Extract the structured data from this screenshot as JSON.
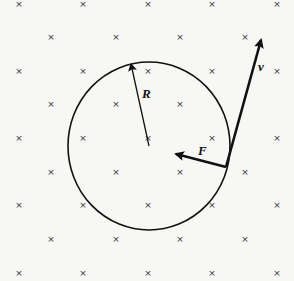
{
  "diagram": {
    "background_color": "#f7f7f5",
    "ink_color": "#111111",
    "field": {
      "symbol": "×",
      "meaning": "magnetic field into page",
      "rows": [
        {
          "y": 7,
          "xs": [
            19,
            83,
            148,
            212,
            277
          ]
        },
        {
          "y": 40,
          "xs": [
            51,
            116,
            180,
            245
          ]
        },
        {
          "y": 74,
          "xs": [
            19,
            83,
            148,
            212,
            277
          ]
        },
        {
          "y": 107,
          "xs": [
            51,
            116,
            180
          ]
        },
        {
          "y": 141,
          "xs": [
            19,
            83,
            148,
            212,
            277
          ]
        },
        {
          "y": 175,
          "xs": [
            51,
            116,
            180,
            245
          ]
        },
        {
          "y": 208,
          "xs": [
            19,
            83,
            148,
            212,
            277
          ]
        },
        {
          "y": 242,
          "xs": [
            51,
            116,
            180,
            245
          ]
        },
        {
          "y": 276,
          "xs": [
            19,
            83,
            148,
            212,
            277
          ]
        }
      ]
    },
    "circle": {
      "cx": 149,
      "cy": 146,
      "rx": 81,
      "ry": 84
    },
    "vectors": {
      "radius": {
        "label": "R",
        "from": [
          149,
          146
        ],
        "to": [
          131,
          64
        ],
        "label_pos": [
          142,
          98
        ]
      },
      "velocity": {
        "label": "v",
        "from": [
          226,
          167
        ],
        "to": [
          261,
          40
        ],
        "label_pos": [
          258,
          71
        ]
      },
      "force": {
        "label": "F",
        "from": [
          226,
          167
        ],
        "to": [
          176,
          154
        ],
        "label_pos": [
          198,
          155
        ]
      }
    }
  }
}
